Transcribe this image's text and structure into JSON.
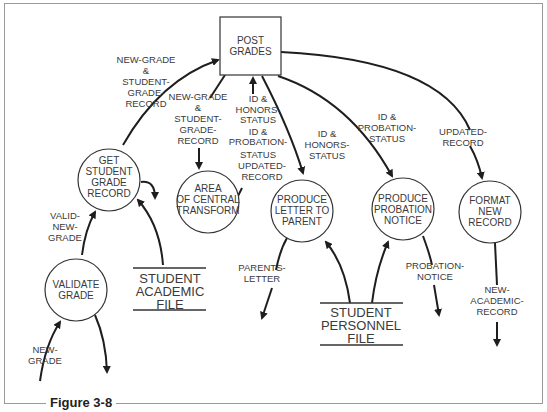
{
  "figure": {
    "caption": "Figure 3-8"
  },
  "nodes": {
    "post_grades": {
      "shape": "rectangle",
      "lines": [
        "POST",
        "GRADES"
      ]
    },
    "get_student_grade_record": {
      "shape": "circle",
      "lines": [
        "GET",
        "STUDENT",
        "GRADE",
        "RECORD"
      ]
    },
    "validate_grade": {
      "shape": "circle",
      "lines": [
        "VALIDATE",
        "GRADE"
      ]
    },
    "area_of_central_transform": {
      "shape": "circle",
      "lines": [
        "AREA",
        "OF CENTRAL",
        "TRANSFORM"
      ]
    },
    "produce_letter_to_parent": {
      "shape": "circle",
      "lines": [
        "PRODUCE",
        "LETTER TO",
        "PARENT"
      ]
    },
    "produce_probation_notice": {
      "shape": "circle",
      "lines": [
        "PRODUCE",
        "PROBATION",
        "NOTICE"
      ]
    },
    "format_new_record": {
      "shape": "circle",
      "lines": [
        "FORMAT",
        "NEW",
        "RECORD"
      ]
    }
  },
  "stores": {
    "student_academic_file": {
      "lines": [
        "STUDENT",
        "ACADEMIC",
        "FILE"
      ]
    },
    "student_personnel_file": {
      "lines": [
        "STUDENT",
        "PERSONNEL",
        "FILE"
      ]
    }
  },
  "flows": {
    "new_grade_in": {
      "lines": [
        "NEW-",
        "GRADE"
      ]
    },
    "valid_new_grade": {
      "lines": [
        "VALID-",
        "NEW-",
        "GRADE"
      ]
    },
    "to_post_grades": {
      "lines": [
        "NEW-GRADE",
        "&",
        "STUDENT-",
        "GRADE-",
        "RECORD"
      ]
    },
    "to_central": {
      "lines": [
        "NEW-GRADE",
        "&",
        "STUDENT-",
        "GRADE-",
        "RECORD"
      ]
    },
    "central_returns": {
      "lines": [
        "ID &",
        "HONORS-",
        "STATUS",
        "ID &",
        "PROBATION-",
        "STATUS",
        "UPDATED-",
        "RECORD"
      ]
    },
    "to_letter": {
      "lines": [
        "ID &",
        "HONORS-",
        "STATUS"
      ]
    },
    "to_probation": {
      "lines": [
        "ID &",
        "PROBATION-",
        "STATUS"
      ]
    },
    "to_format": {
      "lines": [
        "UPDATED-",
        "RECORD"
      ]
    },
    "parents_letter": {
      "lines": [
        "PARENTS-",
        "LETTER"
      ]
    },
    "probation_notice": {
      "lines": [
        "PROBATION-",
        "NOTICE"
      ]
    },
    "new_academic_record": {
      "lines": [
        "NEW-",
        "ACADEMIC-",
        "RECORD"
      ]
    }
  }
}
